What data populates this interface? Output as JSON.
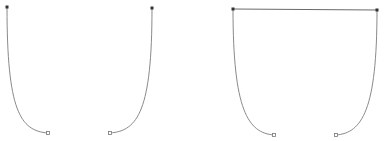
{
  "diagram": {
    "background": "#ffffff",
    "stroke_color": "#8a8a8a",
    "line_color": "#6a6a6a",
    "anchor_color": "#333333",
    "open_point_stroke": "#777777",
    "figures": [
      {
        "name": "left-figure",
        "curves": [
          {
            "name": "left-curve",
            "start": [
              7,
              7
            ],
            "c1": [
              7,
              110
            ],
            "c2": [
              20,
              131
            ],
            "end": [
              48,
              133
            ]
          },
          {
            "name": "right-curve",
            "start": [
              152,
              8
            ],
            "c1": [
              152,
              110
            ],
            "c2": [
              138,
              131
            ],
            "end": [
              110,
              133
            ]
          }
        ],
        "connector": null
      },
      {
        "name": "right-figure",
        "curves": [
          {
            "name": "left-curve",
            "start": [
              233,
              9
            ],
            "c1": [
              233,
              110
            ],
            "c2": [
              248,
              133
            ],
            "end": [
              274,
              135
            ]
          },
          {
            "name": "right-curve",
            "start": [
              377,
              10
            ],
            "c1": [
              377,
              110
            ],
            "c2": [
              362,
              133
            ],
            "end": [
              336,
              135
            ]
          }
        ],
        "connector": {
          "from": [
            233,
            9
          ],
          "to": [
            377,
            10
          ]
        }
      }
    ]
  }
}
